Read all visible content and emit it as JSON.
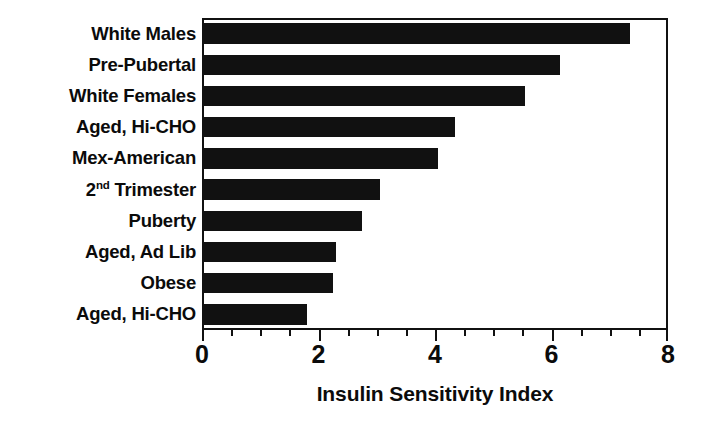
{
  "chart_data": {
    "type": "bar",
    "orientation": "horizontal",
    "title": "",
    "xlabel": "Insulin Sensitivity Index",
    "ylabel": "",
    "xlim": [
      0,
      8
    ],
    "xticks": [
      "0",
      "2",
      "4",
      "6",
      "8"
    ],
    "xtick_values": [
      0,
      2,
      4,
      6,
      8
    ],
    "minor_tick_step": 0.5,
    "grid": false,
    "legend": null,
    "bar_color": "#111111",
    "frame_color": "#111111",
    "categories": [
      "White Males",
      "Pre-Pubertal",
      "White Females",
      "Aged, Hi-CHO",
      "Mex-American",
      "2nd Trimester",
      "Puberty",
      "Aged, Ad Lib",
      "Obese",
      "Aged, Hi-CHO"
    ],
    "values": [
      7.35,
      6.15,
      5.55,
      4.35,
      4.05,
      3.05,
      2.75,
      2.3,
      2.25,
      1.8
    ],
    "bars": [
      {
        "label": "White Males",
        "label_pre": "White Males",
        "label_sup": "",
        "label_post": "",
        "value": 7.35
      },
      {
        "label": "Pre-Pubertal",
        "label_pre": "Pre-Pubertal",
        "label_sup": "",
        "label_post": "",
        "value": 6.15
      },
      {
        "label": "White Females",
        "label_pre": "White Females",
        "label_sup": "",
        "label_post": "",
        "value": 5.55
      },
      {
        "label": "Aged, Hi-CHO",
        "label_pre": "Aged, Hi-CHO",
        "label_sup": "",
        "label_post": "",
        "value": 4.35
      },
      {
        "label": "Mex-American",
        "label_pre": "Mex-American",
        "label_sup": "",
        "label_post": "",
        "value": 4.05
      },
      {
        "label": "2nd Trimester",
        "label_pre": "2",
        "label_sup": "nd",
        "label_post": " Trimester",
        "value": 3.05
      },
      {
        "label": "Puberty",
        "label_pre": "Puberty",
        "label_sup": "",
        "label_post": "",
        "value": 2.75
      },
      {
        "label": "Aged, Ad Lib",
        "label_pre": "Aged, Ad Lib",
        "label_sup": "",
        "label_post": "",
        "value": 2.3
      },
      {
        "label": "Obese",
        "label_pre": "Obese",
        "label_sup": "",
        "label_post": "",
        "value": 2.25
      },
      {
        "label": "Aged, Hi-CHO",
        "label_pre": "Aged, Hi-CHO",
        "label_sup": "",
        "label_post": "",
        "value": 1.8
      }
    ]
  }
}
